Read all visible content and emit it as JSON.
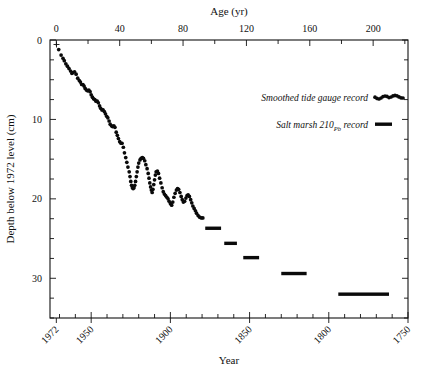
{
  "figure": {
    "background": "#ffffff",
    "foreground": "#111111"
  },
  "chart_data": {
    "type": "scatter",
    "title": "",
    "top_axis": {
      "label": "Age (yr)",
      "ticks": [
        0,
        20,
        40,
        60,
        80,
        100,
        120,
        140,
        160,
        180,
        200,
        220
      ],
      "major_ticks": [
        0,
        40,
        80,
        120,
        160,
        200
      ],
      "major_tick_labels": [
        "0",
        "40",
        "80",
        "120",
        "160",
        "200"
      ],
      "range": [
        -4,
        222
      ]
    },
    "bottom_axis": {
      "label": "Year",
      "major_ticks": [
        1972,
        1950,
        1900,
        1850,
        1800,
        1750
      ],
      "major_tick_labels": [
        "1972",
        "1950",
        "1900",
        "1850",
        "1800",
        "1750"
      ],
      "minor_tick_interval": 10,
      "range": [
        1976,
        1750
      ],
      "label_rotation": -45
    },
    "y_axis": {
      "label": "Depth below 1972 level (cm)",
      "major_ticks": [
        0,
        10,
        20,
        30
      ],
      "major_tick_labels": [
        "0",
        "10",
        "20",
        "30"
      ],
      "minor_tick_interval": 2.5,
      "range": [
        0,
        35
      ],
      "direction": "inverted"
    },
    "grid": false,
    "legend_position": "upper-right",
    "origin_marker": "+",
    "series": [
      {
        "name": "Smoothed tide gauge record",
        "marker": "dot",
        "color": "#0a0a0a",
        "points": [
          [
            1.5,
            1.2
          ],
          [
            3.0,
            1.9
          ],
          [
            4.2,
            2.3
          ],
          [
            5.0,
            2.6
          ],
          [
            6.0,
            3.0
          ],
          [
            7.0,
            3.3
          ],
          [
            8.0,
            3.6
          ],
          [
            9.0,
            3.9
          ],
          [
            9.8,
            4.2
          ],
          [
            10.5,
            4.1
          ],
          [
            11.5,
            4.0
          ],
          [
            12.5,
            4.3
          ],
          [
            13.5,
            4.8
          ],
          [
            14.5,
            5.1
          ],
          [
            15.2,
            5.3
          ],
          [
            16.0,
            5.6
          ],
          [
            16.8,
            5.6
          ],
          [
            17.5,
            5.8
          ],
          [
            18.2,
            6.1
          ],
          [
            19.0,
            6.3
          ],
          [
            19.8,
            6.4
          ],
          [
            20.5,
            6.3
          ],
          [
            21.3,
            6.5
          ],
          [
            22.0,
            6.9
          ],
          [
            22.8,
            7.2
          ],
          [
            23.5,
            7.4
          ],
          [
            24.3,
            7.5
          ],
          [
            25.0,
            7.7
          ],
          [
            25.8,
            7.7
          ],
          [
            26.5,
            7.9
          ],
          [
            27.3,
            8.3
          ],
          [
            28.0,
            8.6
          ],
          [
            28.8,
            8.8
          ],
          [
            29.5,
            8.8
          ],
          [
            30.3,
            9.0
          ],
          [
            31.0,
            9.3
          ],
          [
            31.8,
            9.6
          ],
          [
            32.5,
            9.8
          ],
          [
            33.3,
            10.2
          ],
          [
            34.0,
            10.6
          ],
          [
            34.8,
            10.8
          ],
          [
            35.5,
            10.9
          ],
          [
            36.3,
            10.8
          ],
          [
            37.0,
            11.0
          ],
          [
            37.8,
            11.6
          ],
          [
            38.5,
            12.0
          ],
          [
            39.2,
            12.4
          ],
          [
            40.0,
            12.8
          ],
          [
            40.8,
            13.0
          ],
          [
            41.5,
            13.0
          ],
          [
            42.3,
            13.5
          ],
          [
            43.0,
            14.2
          ],
          [
            43.8,
            14.8
          ],
          [
            44.5,
            15.4
          ],
          [
            45.2,
            16.0
          ],
          [
            46.0,
            16.6
          ],
          [
            46.5,
            17.2
          ],
          [
            47.0,
            17.8
          ],
          [
            47.5,
            18.3
          ],
          [
            48.0,
            18.6
          ],
          [
            48.5,
            18.7
          ],
          [
            49.0,
            18.6
          ],
          [
            49.5,
            18.3
          ],
          [
            50.0,
            17.8
          ],
          [
            50.5,
            17.2
          ],
          [
            51.0,
            16.6
          ],
          [
            51.5,
            16.0
          ],
          [
            52.0,
            15.5
          ],
          [
            52.8,
            15.1
          ],
          [
            53.5,
            14.9
          ],
          [
            54.3,
            14.8
          ],
          [
            55.0,
            14.9
          ],
          [
            55.8,
            15.2
          ],
          [
            56.5,
            15.7
          ],
          [
            57.3,
            16.2
          ],
          [
            58.0,
            16.8
          ],
          [
            58.5,
            17.4
          ],
          [
            59.0,
            18.0
          ],
          [
            59.5,
            18.5
          ],
          [
            60.0,
            18.9
          ],
          [
            60.5,
            19.2
          ],
          [
            61.0,
            18.8
          ],
          [
            61.5,
            18.2
          ],
          [
            62.0,
            17.6
          ],
          [
            62.5,
            17.0
          ],
          [
            63.0,
            16.6
          ],
          [
            63.8,
            16.5
          ],
          [
            64.5,
            16.8
          ],
          [
            65.2,
            17.4
          ],
          [
            66.0,
            18.0
          ],
          [
            66.8,
            18.6
          ],
          [
            67.5,
            19.1
          ],
          [
            68.2,
            19.4
          ],
          [
            69.0,
            19.6
          ],
          [
            69.8,
            19.8
          ],
          [
            70.5,
            20.0
          ],
          [
            71.2,
            20.3
          ],
          [
            72.0,
            20.6
          ],
          [
            72.8,
            20.8
          ],
          [
            73.5,
            20.4
          ],
          [
            74.2,
            19.8
          ],
          [
            75.0,
            19.3
          ],
          [
            75.8,
            18.9
          ],
          [
            76.5,
            18.7
          ],
          [
            77.2,
            18.8
          ],
          [
            78.0,
            19.2
          ],
          [
            78.8,
            19.7
          ],
          [
            79.5,
            20.1
          ],
          [
            80.2,
            20.4
          ],
          [
            81.0,
            20.3
          ],
          [
            81.8,
            19.9
          ],
          [
            82.5,
            19.6
          ],
          [
            83.2,
            19.5
          ],
          [
            84.0,
            19.7
          ],
          [
            84.8,
            20.1
          ],
          [
            85.5,
            20.5
          ],
          [
            86.2,
            20.9
          ],
          [
            87.0,
            21.2
          ],
          [
            87.8,
            21.5
          ],
          [
            88.5,
            21.8
          ],
          [
            89.5,
            22.1
          ],
          [
            90.5,
            22.3
          ],
          [
            91.5,
            22.4
          ],
          [
            92.5,
            22.4
          ]
        ]
      }
    ],
    "marsh_bars": [
      {
        "age_start": 94,
        "age_end": 104,
        "depth": 23.7
      },
      {
        "age_start": 106,
        "age_end": 114,
        "depth": 25.6
      },
      {
        "age_start": 118,
        "age_end": 128,
        "depth": 27.4
      },
      {
        "age_start": 142,
        "age_end": 158,
        "depth": 29.4
      },
      {
        "age_start": 178,
        "age_end": 210,
        "depth": 32.0
      }
    ]
  },
  "legend": {
    "entries": [
      {
        "label": "Smoothed tide gauge record",
        "marker": "dotted-wavy",
        "color": "#0a0a0a"
      },
      {
        "label_prefix": "Salt marsh 210",
        "label_sub": "Pb",
        "label_suffix": " record",
        "marker": "thick-bar",
        "color": "#0a0a0a"
      }
    ]
  }
}
